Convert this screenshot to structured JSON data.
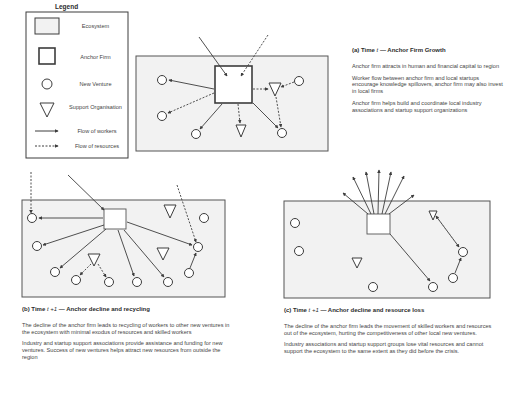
{
  "legend": {
    "title": "Legend",
    "items": [
      {
        "symbol": "ecosystem-rect",
        "label": "Ecosystem"
      },
      {
        "symbol": "anchor-square",
        "label": "Anchor Firm"
      },
      {
        "symbol": "circle",
        "label": "New Venture"
      },
      {
        "symbol": "triangle-down",
        "label": "Support Organisation"
      },
      {
        "symbol": "solid-arrow",
        "label": "Flow of workers"
      },
      {
        "symbol": "dashed-arrow",
        "label": "Flow of resources"
      }
    ]
  },
  "panel_a": {
    "caption_prefix": "(a) Time ",
    "caption_var": "t",
    "caption_suffix": " — Anchor Firm Growth",
    "paragraphs": [
      "Anchor firm attracts in human and financial capital to region",
      "Worker flow between anchor firm and local startups encourage knowledge spillovers, anchor firm may also invest in local firms",
      "Anchor firm helps build and coordinate local industry associations and startup support organizations"
    ]
  },
  "panel_b": {
    "caption_prefix": "(b) Time ",
    "caption_var": "t +1",
    "caption_suffix": " — Anchor decline and recycling",
    "paragraphs": [
      "The decline of the anchor firm leads to  recycling of workers to other new ventures in the ecosystem with minimal exodus of resources and skilled workers",
      "Industry and startup support associations provide assistance and funding for new ventures. Success of new ventures helps attract new resources from outside the region"
    ]
  },
  "panel_c": {
    "caption_prefix": "(c) Time ",
    "caption_var": "t +1",
    "caption_suffix": " — Anchor decline and resource loss",
    "paragraphs": [
      "The decline of the anchor firm leads the movement of skilled workers and resources out of the ecosystem, hurting the competitiveness of other local new ventures.",
      "Industry associations and startup support groups lose vital resources and cannot support the ecosystem to the same extent as they did before the crisis."
    ]
  },
  "colors": {
    "ecosystem_fill": "#f2f2f2",
    "stroke": "#3c3c3c",
    "background": "#ffffff"
  }
}
